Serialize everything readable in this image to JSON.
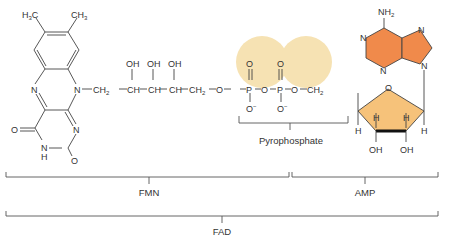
{
  "diagram": {
    "colors": {
      "phosphate_highlight": "#f6e2b3",
      "adenine_fill": "#f08a4b",
      "ribose_fill": "#f6c27a",
      "line": "#444444",
      "text": "#333333"
    },
    "flavin": {
      "methyl_left": "H3C",
      "methyl_right": "CH3",
      "n_ring_left": "N",
      "n_ring_right": "N",
      "n_lower": "N",
      "nh": "N",
      "nh_h": "H",
      "oxo_left": "O",
      "oxo_bottom": "O"
    },
    "ribityl_chain": {
      "ch2_first": "CH2",
      "hydroxyls": [
        "OH",
        "OH",
        "OH"
      ],
      "ch_groups": [
        "CH",
        "CH",
        "CH"
      ],
      "ch2_last": "CH2"
    },
    "pyrophosphate": {
      "atoms": [
        "O",
        "P",
        "O",
        "P",
        "O"
      ],
      "double_bond_oxygens": [
        "O",
        "O"
      ],
      "anionic_oxygens": [
        "O−",
        "O−"
      ],
      "label": "Pyrophosphate"
    },
    "adenosine": {
      "amine": "NH2",
      "ring_nitrogens": [
        "N",
        "N",
        "N",
        "N"
      ],
      "ch2": "CH2",
      "ring_oxygen": "O",
      "ring_hydrogens": [
        "H",
        "H",
        "H",
        "H"
      ],
      "hydroxyls": [
        "OH",
        "OH"
      ]
    },
    "brackets": [
      {
        "label": "FMN",
        "x1": 6,
        "x2": 289
      },
      {
        "label": "AMP",
        "x1": 292,
        "x2": 438
      },
      {
        "label": "FAD",
        "x1": 6,
        "x2": 438
      }
    ]
  }
}
